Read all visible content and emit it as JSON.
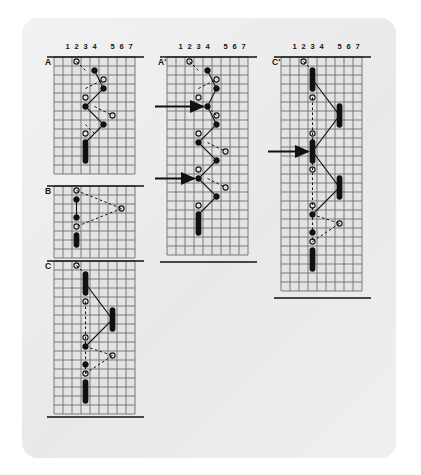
{
  "figure": {
    "title": "Haplotype grid diagram",
    "background_color": "#ffffff",
    "card_color": "#ececec",
    "ink_color": "#111111",
    "grid_line_color": "#6d6d6d",
    "grid_cell_px": 9,
    "column_headers": [
      "1",
      "2",
      "3",
      "4",
      "5",
      "6",
      "7"
    ],
    "marker_legend": {
      "filled_circle": "filled-circle-marker",
      "open_circle": "open-circle-marker",
      "black_bar": "black-bar-marker",
      "solid_line": "solid-connector",
      "dashed_line": "dashed-connector",
      "arrow": "pointer-arrow"
    },
    "panels": [
      {
        "id": "panel-a",
        "label": "A",
        "x": 54,
        "y": 57,
        "cols": 9,
        "rows": 13,
        "headers_y": 51,
        "markers": [
          {
            "type": "open-circle",
            "col": 2,
            "row": 0
          },
          {
            "type": "filled-circle",
            "col": 4,
            "row": 1
          },
          {
            "type": "open-circle",
            "col": 5,
            "row": 2
          },
          {
            "type": "filled-circle",
            "col": 5,
            "row": 3
          },
          {
            "type": "open-circle",
            "col": 3,
            "row": 4
          },
          {
            "type": "filled-circle",
            "col": 3,
            "row": 5
          },
          {
            "type": "open-circle",
            "col": 6,
            "row": 6
          },
          {
            "type": "filled-circle",
            "col": 5,
            "row": 7
          },
          {
            "type": "open-circle",
            "col": 3,
            "row": 8
          },
          {
            "type": "black-bar",
            "col": 3,
            "row": 9,
            "span": 3
          }
        ],
        "solid_path": [
          [
            4,
            1
          ],
          [
            5,
            3
          ],
          [
            3,
            5
          ],
          [
            5,
            7
          ],
          [
            3,
            9
          ]
        ],
        "dashed_segments": [
          [
            [
              2,
              0
            ],
            [
              3,
              1
            ]
          ],
          [
            [
              3,
              3
            ],
            [
              5,
              2
            ]
          ],
          [
            [
              4,
              5
            ],
            [
              6,
              6
            ]
          ],
          [
            [
              3,
              7
            ],
            [
              4,
              8
            ]
          ]
        ]
      },
      {
        "id": "panel-b",
        "label": "B",
        "x": 54,
        "y": 186,
        "cols": 9,
        "rows": 8,
        "markers": [
          {
            "type": "open-circle",
            "col": 2,
            "row": 0
          },
          {
            "type": "filled-circle",
            "col": 2,
            "row": 1
          },
          {
            "type": "open-circle",
            "col": 7,
            "row": 2
          },
          {
            "type": "filled-circle",
            "col": 2,
            "row": 3
          },
          {
            "type": "open-circle",
            "col": 2,
            "row": 4
          },
          {
            "type": "black-bar",
            "col": 2,
            "row": 5,
            "span": 2
          }
        ],
        "solid_path": [
          [
            2,
            1
          ],
          [
            2,
            3
          ]
        ],
        "dashed_segments": [
          [
            [
              2,
              0
            ],
            [
              7,
              2
            ]
          ],
          [
            [
              7,
              2
            ],
            [
              2,
              4
            ]
          ]
        ]
      },
      {
        "id": "panel-c",
        "label": "C",
        "x": 54,
        "y": 261,
        "cols": 9,
        "rows": 17,
        "markers": [
          {
            "type": "open-circle",
            "col": 2,
            "row": 0
          },
          {
            "type": "black-bar",
            "col": 3,
            "row": 1,
            "span": 3
          },
          {
            "type": "open-circle",
            "col": 3,
            "row": 4
          },
          {
            "type": "black-bar",
            "col": 6,
            "row": 5,
            "span": 3
          },
          {
            "type": "open-circle",
            "col": 3,
            "row": 8
          },
          {
            "type": "filled-circle",
            "col": 3,
            "row": 9
          },
          {
            "type": "open-circle",
            "col": 6,
            "row": 10
          },
          {
            "type": "filled-circle",
            "col": 3,
            "row": 11
          },
          {
            "type": "open-circle",
            "col": 3,
            "row": 12
          },
          {
            "type": "black-bar",
            "col": 3,
            "row": 13,
            "span": 3
          }
        ],
        "solid_path": [
          [
            3,
            2
          ],
          [
            6,
            6
          ],
          [
            3,
            9
          ]
        ],
        "dashed_segments": [
          [
            [
              2,
              0
            ],
            [
              3,
              1
            ]
          ],
          [
            [
              3,
              9
            ],
            [
              6,
              10
            ]
          ],
          [
            [
              6,
              10
            ],
            [
              3,
              12
            ]
          ]
        ],
        "dashed_vertical": [
          [
            3,
            4
          ],
          [
            3,
            12
          ]
        ]
      },
      {
        "id": "panel-a-prime",
        "label": "A'",
        "x": 167,
        "y": 57,
        "cols": 9,
        "rows": 22,
        "headers_y": 51,
        "markers": [
          {
            "type": "open-circle",
            "col": 2,
            "row": 0
          },
          {
            "type": "filled-circle",
            "col": 4,
            "row": 1
          },
          {
            "type": "open-circle",
            "col": 5,
            "row": 2
          },
          {
            "type": "filled-circle",
            "col": 5,
            "row": 3
          },
          {
            "type": "open-circle",
            "col": 3,
            "row": 4
          },
          {
            "type": "filled-circle",
            "col": 4,
            "row": 5
          },
          {
            "type": "open-circle",
            "col": 5,
            "row": 6
          },
          {
            "type": "filled-circle",
            "col": 5,
            "row": 7
          },
          {
            "type": "open-circle",
            "col": 3,
            "row": 8
          },
          {
            "type": "filled-circle",
            "col": 3,
            "row": 9
          },
          {
            "type": "open-circle",
            "col": 6,
            "row": 10
          },
          {
            "type": "filled-circle",
            "col": 5,
            "row": 11
          },
          {
            "type": "open-circle",
            "col": 3,
            "row": 12
          },
          {
            "type": "filled-circle",
            "col": 3,
            "row": 13
          },
          {
            "type": "open-circle",
            "col": 6,
            "row": 14
          },
          {
            "type": "filled-circle",
            "col": 5,
            "row": 15
          },
          {
            "type": "open-circle",
            "col": 3,
            "row": 16
          },
          {
            "type": "black-bar",
            "col": 3,
            "row": 17,
            "span": 3
          }
        ],
        "solid_path": [
          [
            4,
            1
          ],
          [
            5,
            3
          ],
          [
            4,
            5
          ],
          [
            5,
            7
          ],
          [
            3,
            9
          ],
          [
            5,
            11
          ],
          [
            3,
            13
          ],
          [
            5,
            15
          ],
          [
            3,
            17
          ]
        ],
        "dashed_segments": [
          [
            [
              2,
              0
            ],
            [
              3,
              1
            ]
          ],
          [
            [
              3,
              3
            ],
            [
              5,
              2
            ]
          ],
          [
            [
              4,
              5
            ],
            [
              5,
              6
            ]
          ],
          [
            [
              4,
              9
            ],
            [
              6,
              10
            ]
          ],
          [
            [
              4,
              13
            ],
            [
              6,
              14
            ]
          ]
        ],
        "arrows": [
          {
            "target_col": 4,
            "target_row": 5,
            "from_x": 155
          },
          {
            "target_col": 3,
            "target_row": 13,
            "from_x": 155
          }
        ]
      },
      {
        "id": "panel-c-prime",
        "label": "C'",
        "x": 281,
        "y": 57,
        "cols": 9,
        "rows": 26,
        "headers_y": 51,
        "markers": [
          {
            "type": "open-circle",
            "col": 2,
            "row": 0
          },
          {
            "type": "black-bar",
            "col": 3,
            "row": 1,
            "span": 3
          },
          {
            "type": "open-circle",
            "col": 3,
            "row": 4
          },
          {
            "type": "black-bar",
            "col": 6,
            "row": 5,
            "span": 3
          },
          {
            "type": "open-circle",
            "col": 3,
            "row": 8
          },
          {
            "type": "black-bar",
            "col": 3,
            "row": 9,
            "span": 3
          },
          {
            "type": "open-circle",
            "col": 3,
            "row": 12
          },
          {
            "type": "black-bar",
            "col": 6,
            "row": 13,
            "span": 3
          },
          {
            "type": "open-circle",
            "col": 3,
            "row": 16
          },
          {
            "type": "filled-circle",
            "col": 3,
            "row": 17
          },
          {
            "type": "open-circle",
            "col": 6,
            "row": 18
          },
          {
            "type": "filled-circle",
            "col": 3,
            "row": 19
          },
          {
            "type": "open-circle",
            "col": 3,
            "row": 20
          },
          {
            "type": "black-bar",
            "col": 3,
            "row": 21,
            "span": 3
          }
        ],
        "solid_path": [
          [
            3,
            2
          ],
          [
            6,
            6
          ],
          [
            3,
            10
          ],
          [
            6,
            14
          ],
          [
            3,
            17
          ]
        ],
        "dashed_segments": [
          [
            [
              2,
              0
            ],
            [
              3,
              1
            ]
          ],
          [
            [
              3,
              17
            ],
            [
              6,
              18
            ]
          ],
          [
            [
              6,
              18
            ],
            [
              3,
              20
            ]
          ]
        ],
        "dashed_vertical": [
          [
            3,
            4
          ],
          [
            3,
            20
          ]
        ],
        "arrows": [
          {
            "target_col": 3,
            "target_row": 10,
            "from_x": 268
          }
        ]
      }
    ],
    "divider_lines": [
      {
        "name": "panel-a-top-rule",
        "x1": 47,
        "y1": 57,
        "x2": 144,
        "y2": 57
      },
      {
        "name": "panel-b-top-rule",
        "x1": 47,
        "y1": 186,
        "x2": 144,
        "y2": 186
      },
      {
        "name": "panel-c-top-rule",
        "x1": 47,
        "y1": 261,
        "x2": 144,
        "y2": 261
      },
      {
        "name": "panel-c-bottom-rule",
        "x1": 47,
        "y1": 417,
        "x2": 144,
        "y2": 417
      },
      {
        "name": "panel-a-prime-top-rule",
        "x1": 160,
        "y1": 57,
        "x2": 257,
        "y2": 57
      },
      {
        "name": "panel-a-prime-bottom-rule",
        "x1": 160,
        "y1": 262,
        "x2": 257,
        "y2": 262
      },
      {
        "name": "panel-c-prime-top-rule",
        "x1": 274,
        "y1": 57,
        "x2": 371,
        "y2": 57
      },
      {
        "name": "panel-c-prime-bottom-rule",
        "x1": 274,
        "y1": 298,
        "x2": 371,
        "y2": 298
      }
    ]
  }
}
